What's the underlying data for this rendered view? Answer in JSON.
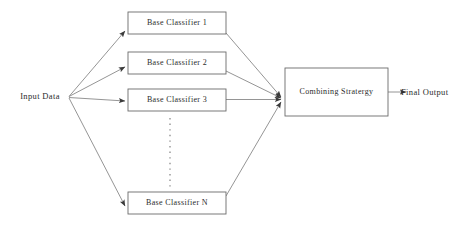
{
  "diagram": {
    "type": "flow-diagram",
    "background_color": "#ffffff",
    "stroke_color": "#6b6b6b",
    "text_color": "#2b2b2b",
    "input": {
      "label": "Input Data",
      "x": 38,
      "y": 97
    },
    "classifiers": [
      {
        "label": "Base Classifier 1",
        "x": 128,
        "y": 12,
        "w": 98,
        "h": 22
      },
      {
        "label": "Base Classifier  2",
        "x": 128,
        "y": 52,
        "w": 98,
        "h": 22
      },
      {
        "label": "Base Classifier  3",
        "x": 128,
        "y": 89,
        "w": 98,
        "h": 22
      },
      {
        "label": "Base Classifier  N",
        "x": 128,
        "y": 192,
        "w": 98,
        "h": 22
      }
    ],
    "ellipsis": {
      "name": "vertical-dots",
      "x": 170,
      "y_start": 118,
      "y_end": 188,
      "count": 13
    },
    "combiner": {
      "label": "Combining Stratergy",
      "x": 285,
      "y": 68,
      "w": 103,
      "h": 48
    },
    "output": {
      "label": "Final Output",
      "x": 404,
      "y": 92
    },
    "fan_out_point": {
      "x": 68,
      "y": 97
    },
    "fan_in_point": {
      "x": 283,
      "y": 99
    }
  }
}
